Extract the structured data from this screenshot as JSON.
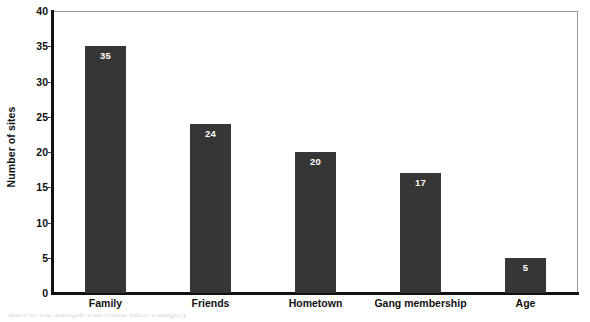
{
  "chart_data": {
    "type": "bar",
    "title": "",
    "subtitle": "",
    "xlabel": "",
    "ylabel": "Number of sites",
    "categories": [
      "Family",
      "Friends",
      "Hometown",
      "Gang membership",
      "Age"
    ],
    "values": [
      35,
      24,
      20,
      17,
      5
    ],
    "data_labels": [
      "35",
      "24",
      "20",
      "17",
      "5"
    ],
    "ylim": [
      0,
      40
    ],
    "y_ticks": [
      0,
      5,
      10,
      15,
      20,
      25,
      30,
      35,
      40
    ],
    "y_tick_labels": [
      "0",
      "5",
      "10",
      "15",
      "20",
      "25",
      "30",
      "35",
      "40"
    ],
    "grid": false,
    "legend": false,
    "legend_position": "none",
    "bar_color": "#363636",
    "data_label_color": "#ffffff",
    "axis_color": "#111111",
    "plot_border_color": "#9a9a9a",
    "background_color": "#ffffff"
  },
  "caption": {
    "partial_line": "sites in the sample that listed each category"
  }
}
